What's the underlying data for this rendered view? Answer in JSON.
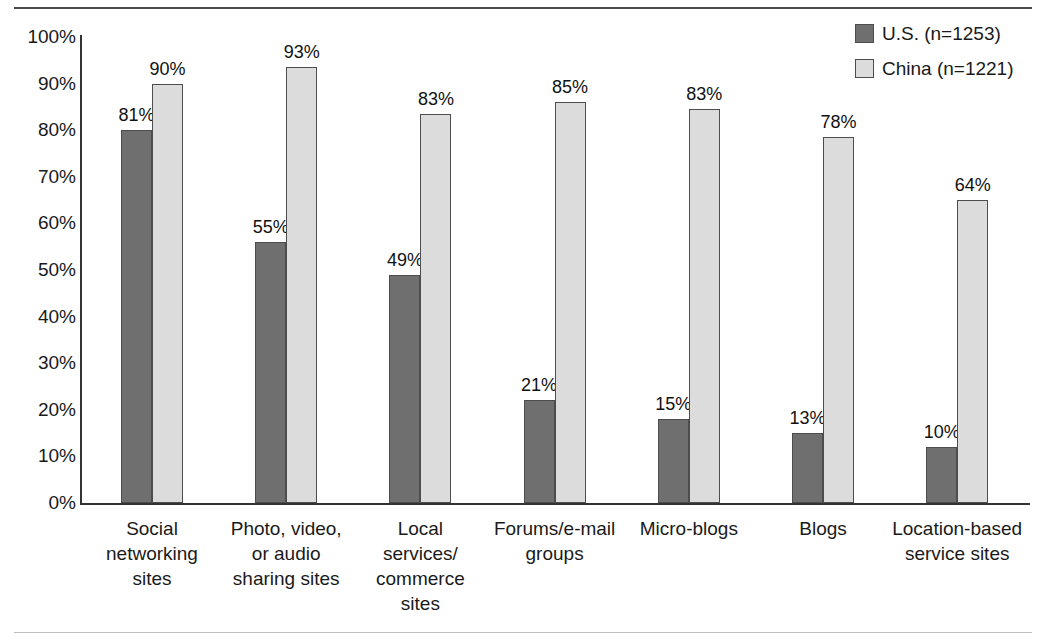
{
  "chart_data": {
    "type": "bar",
    "title": "",
    "xlabel": "",
    "ylabel": "",
    "ylim": [
      0,
      100
    ],
    "grid": false,
    "legend_position": "top-right",
    "categories": [
      "Social\nnetworking\nsites",
      "Photo, video,\nor audio\nsharing sites",
      "Local\nservices/\ncommerce\nsites",
      "Forums/e-mail\ngroups",
      "Micro-blogs",
      "Blogs",
      "Location-based\nservice sites"
    ],
    "ytick_labels": [
      "100%",
      "90%",
      "80%",
      "70%",
      "60%",
      "50%",
      "40%",
      "30%",
      "20%",
      "10%",
      "0%"
    ],
    "ytick_values": [
      100,
      90,
      80,
      70,
      60,
      50,
      40,
      30,
      20,
      10,
      0
    ],
    "series": [
      {
        "name": "U.S. (n=1253)",
        "color": "#6f6f6f",
        "values": [
          81,
          55,
          49,
          21,
          15,
          13,
          10
        ],
        "bar_heights": [
          80,
          56,
          49,
          22,
          18,
          15,
          12
        ],
        "labels": [
          "81%",
          "55%",
          "49%",
          "21%",
          "15%",
          "13%",
          "10%"
        ]
      },
      {
        "name": "China (n=1221)",
        "color": "#dcdcdc",
        "values": [
          90,
          93,
          83,
          85,
          83,
          78,
          64
        ],
        "bar_heights": [
          90,
          93.5,
          83.5,
          86,
          84.5,
          78.5,
          65
        ],
        "labels": [
          "90%",
          "93%",
          "83%",
          "85%",
          "83%",
          "78%",
          "64%"
        ]
      }
    ]
  },
  "legend": {
    "items": [
      {
        "label": "U.S. (n=1253)",
        "swatch": "us"
      },
      {
        "label": "China (n=1221)",
        "swatch": "china"
      }
    ]
  }
}
